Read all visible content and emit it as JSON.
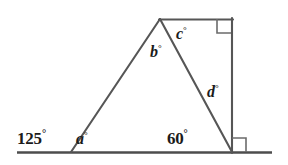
{
  "figure": {
    "stroke_color": "#4a4a4a",
    "baseline_color": "#4d4d4d",
    "text_color": "#1b1b1b",
    "background_color": "#ffffff",
    "degree_symbol": "°"
  },
  "labels": {
    "angle_125": {
      "value": "125",
      "unit": "°",
      "full": "125°"
    },
    "angle_a": {
      "value": "a",
      "unit": "°",
      "full": "a°"
    },
    "angle_b": {
      "value": "b",
      "unit": "°",
      "full": "b°"
    },
    "angle_c": {
      "value": "c",
      "unit": "°",
      "full": "c°"
    },
    "angle_d": {
      "value": "d",
      "unit": "°",
      "full": "d°"
    },
    "angle_60": {
      "value": "60",
      "unit": "°",
      "full": "60°"
    }
  },
  "geometry": {
    "baseline": {
      "x1": 17,
      "y1": 152,
      "x2": 272,
      "y2": 152
    },
    "points": {
      "apex": {
        "x": 160,
        "y": 19
      },
      "top_right": {
        "x": 232,
        "y": 19
      },
      "bottom_right": {
        "x": 232,
        "y": 152
      },
      "bottom_left": {
        "x": 71,
        "y": 152
      }
    },
    "segments": [
      {
        "name": "left-slant-side",
        "x1": 71,
        "y1": 152,
        "x2": 160,
        "y2": 19
      },
      {
        "name": "top-side",
        "x1": 160,
        "y1": 19,
        "x2": 232,
        "y2": 19
      },
      {
        "name": "right-vertical",
        "x1": 232,
        "y1": 19,
        "x2": 232,
        "y2": 152
      },
      {
        "name": "inner-diagonal",
        "x1": 160,
        "y1": 19,
        "x2": 232,
        "y2": 152
      }
    ],
    "right_angle_markers": [
      {
        "name": "top-right-square",
        "x": 215,
        "y": 19,
        "size": 14,
        "dir_x": 1,
        "dir_y": 1
      },
      {
        "name": "bottom-right-square",
        "x": 232,
        "y": 138,
        "size": 14,
        "dir_x": 1,
        "dir_y": 1
      }
    ]
  }
}
